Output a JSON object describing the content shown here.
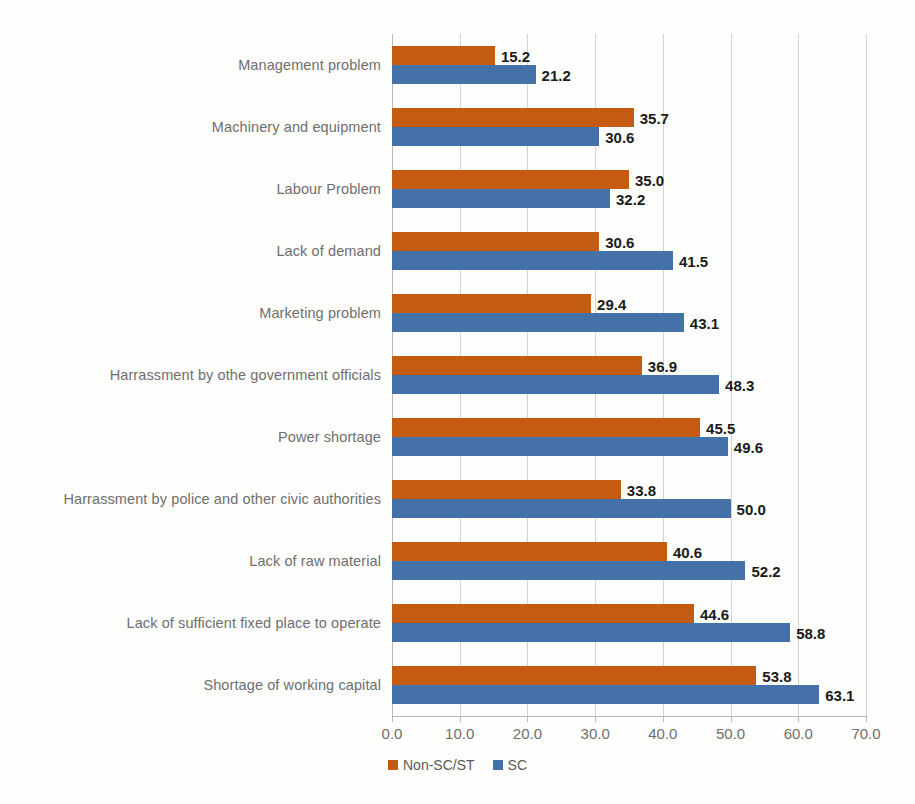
{
  "chart_data": {
    "type": "bar",
    "orientation": "horizontal",
    "title": "",
    "subtitle": "",
    "xlabel": "",
    "ylabel": "",
    "xlim": [
      0.0,
      70.0
    ],
    "xticks": [
      "0.0",
      "10.0",
      "20.0",
      "30.0",
      "40.0",
      "50.0",
      "60.0",
      "70.0"
    ],
    "xtick_values": [
      0,
      10,
      20,
      30,
      40,
      50,
      60,
      70
    ],
    "grid": "vertical",
    "legend_position": "bottom-center",
    "categories": [
      "Management problem",
      "Machinery and equipment",
      "Labour Problem",
      "Lack of demand",
      "Marketing problem",
      "Harrassment by othe government officials",
      "Power shortage",
      "Harrassment by police and other civic authorities",
      "Lack of raw material",
      "Lack of sufficient fixed place to operate",
      "Shortage of working capital"
    ],
    "series": [
      {
        "name": "Non-SC/ST",
        "color": "#C55A11",
        "values": [
          15.2,
          35.7,
          35.0,
          30.6,
          29.4,
          36.9,
          45.5,
          33.8,
          40.6,
          44.6,
          53.8
        ],
        "labels": [
          "15.2",
          "35.7",
          "35.0",
          "30.6",
          "29.4",
          "36.9",
          "45.5",
          "33.8",
          "40.6",
          "44.6",
          "53.8"
        ]
      },
      {
        "name": "SC",
        "color": "#4472A8",
        "values": [
          21.2,
          30.6,
          32.2,
          41.5,
          43.1,
          48.3,
          49.6,
          50.0,
          52.2,
          58.8,
          63.1
        ],
        "labels": [
          "21.2",
          "30.6",
          "32.2",
          "41.5",
          "43.1",
          "48.3",
          "49.6",
          "50.0",
          "52.2",
          "58.8",
          "63.1"
        ]
      }
    ]
  }
}
